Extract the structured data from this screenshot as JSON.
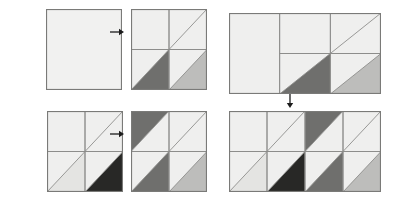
{
  "figure": {
    "title": "",
    "background_color": "#ffffff",
    "palette": {
      "blank": "#f1f1f0",
      "light": "#efefee",
      "pale": "#e4e4e2",
      "mid": "#bdbdbb",
      "mid_dark": "#a0a09e",
      "dark": "#6f6f6d",
      "darkest": "#3a3a38",
      "near_black": "#282826",
      "stroke": "#8d8d8b",
      "outer_stroke": "#7a7a78",
      "arrow": "#1c1c1c"
    }
  },
  "panels": [
    {
      "id": "panel-a1",
      "group": "top-left",
      "role": "input",
      "label": "",
      "cols": 1,
      "rows": 1,
      "x": 46,
      "y": 9,
      "w": 76,
      "h": 81,
      "cells": [
        {
          "col": 0,
          "row": 0,
          "diagonal": "none",
          "upper_shade": "blank",
          "lower_shade": "blank"
        }
      ]
    },
    {
      "id": "panel-a2",
      "group": "top-left",
      "role": "output",
      "label": "",
      "cols": 2,
      "rows": 2,
      "x": 131,
      "y": 9,
      "w": 76,
      "h": 81,
      "cells": [
        {
          "col": 0,
          "row": 0,
          "diagonal": "none",
          "upper_shade": "light",
          "lower_shade": "light"
        },
        {
          "col": 1,
          "row": 0,
          "diagonal": "bl-tr",
          "upper_shade": "light",
          "lower_shade": "light"
        },
        {
          "col": 0,
          "row": 1,
          "diagonal": "bl-tr",
          "upper_shade": "light",
          "lower_shade": "dark"
        },
        {
          "col": 1,
          "row": 1,
          "diagonal": "bl-tr",
          "upper_shade": "light",
          "lower_shade": "mid"
        }
      ]
    },
    {
      "id": "panel-b1",
      "group": "bottom-left",
      "role": "input",
      "label": "",
      "cols": 2,
      "rows": 2,
      "x": 47,
      "y": 111,
      "w": 76,
      "h": 81,
      "cells": [
        {
          "col": 0,
          "row": 0,
          "diagonal": "none",
          "upper_shade": "light",
          "lower_shade": "light"
        },
        {
          "col": 1,
          "row": 0,
          "diagonal": "bl-tr",
          "upper_shade": "light",
          "lower_shade": "light"
        },
        {
          "col": 0,
          "row": 1,
          "diagonal": "bl-tr",
          "upper_shade": "light",
          "lower_shade": "pale"
        },
        {
          "col": 1,
          "row": 1,
          "diagonal": "bl-tr",
          "upper_shade": "light",
          "lower_shade": "near_black"
        }
      ]
    },
    {
      "id": "panel-b2",
      "group": "bottom-left",
      "role": "output",
      "label": "",
      "cols": 2,
      "rows": 2,
      "x": 131,
      "y": 111,
      "w": 76,
      "h": 81,
      "cells": [
        {
          "col": 0,
          "row": 0,
          "diagonal": "bl-tr",
          "upper_shade": "dark",
          "lower_shade": "light"
        },
        {
          "col": 1,
          "row": 0,
          "diagonal": "bl-tr",
          "upper_shade": "light",
          "lower_shade": "light"
        },
        {
          "col": 0,
          "row": 1,
          "diagonal": "bl-tr",
          "upper_shade": "light",
          "lower_shade": "dark"
        },
        {
          "col": 1,
          "row": 1,
          "diagonal": "bl-tr",
          "upper_shade": "light",
          "lower_shade": "mid"
        }
      ]
    },
    {
      "id": "panel-c1",
      "group": "right",
      "role": "input",
      "label": "",
      "cols": 3,
      "rows": 2,
      "x": 229,
      "y": 13,
      "w": 152,
      "h": 81,
      "cells": [
        {
          "col": 0,
          "row": 0,
          "diagonal": "none",
          "upper_shade": "light",
          "lower_shade": "light",
          "span_rows": 2
        },
        {
          "col": 1,
          "row": 0,
          "diagonal": "none",
          "upper_shade": "light",
          "lower_shade": "light"
        },
        {
          "col": 2,
          "row": 0,
          "diagonal": "bl-tr",
          "upper_shade": "light",
          "lower_shade": "light"
        },
        {
          "col": 1,
          "row": 1,
          "diagonal": "bl-tr",
          "upper_shade": "light",
          "lower_shade": "dark"
        },
        {
          "col": 2,
          "row": 1,
          "diagonal": "bl-tr",
          "upper_shade": "light",
          "lower_shade": "mid"
        }
      ]
    },
    {
      "id": "panel-c2",
      "group": "right",
      "role": "output",
      "label": "",
      "cols": 4,
      "rows": 2,
      "x": 229,
      "y": 111,
      "w": 152,
      "h": 81,
      "cells": [
        {
          "col": 0,
          "row": 0,
          "diagonal": "none",
          "upper_shade": "light",
          "lower_shade": "light"
        },
        {
          "col": 1,
          "row": 0,
          "diagonal": "bl-tr",
          "upper_shade": "light",
          "lower_shade": "light"
        },
        {
          "col": 2,
          "row": 0,
          "diagonal": "bl-tr",
          "upper_shade": "dark",
          "lower_shade": "light"
        },
        {
          "col": 3,
          "row": 0,
          "diagonal": "bl-tr",
          "upper_shade": "light",
          "lower_shade": "light"
        },
        {
          "col": 0,
          "row": 1,
          "diagonal": "bl-tr",
          "upper_shade": "light",
          "lower_shade": "pale"
        },
        {
          "col": 1,
          "row": 1,
          "diagonal": "bl-tr",
          "upper_shade": "light",
          "lower_shade": "near_black"
        },
        {
          "col": 2,
          "row": 1,
          "diagonal": "bl-tr",
          "upper_shade": "light",
          "lower_shade": "dark"
        },
        {
          "col": 3,
          "row": 1,
          "diagonal": "bl-tr",
          "upper_shade": "light",
          "lower_shade": "mid"
        }
      ]
    }
  ],
  "arrows": [
    {
      "id": "arrow-top-left",
      "direction": "right",
      "x": 110,
      "y": 27,
      "length": 14,
      "label": ""
    },
    {
      "id": "arrow-bottom-left",
      "direction": "right",
      "x": 110,
      "y": 129,
      "length": 14,
      "label": ""
    },
    {
      "id": "arrow-right-down",
      "direction": "down",
      "x": 285,
      "y": 94,
      "length": 14,
      "label": ""
    }
  ]
}
